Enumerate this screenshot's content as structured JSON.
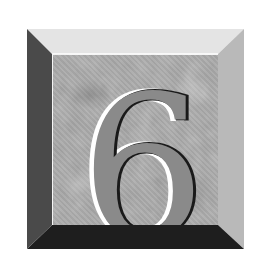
{
  "tile": {
    "numeral": "6",
    "colors": {
      "background": "#ffffff",
      "face": "#a9a9a9",
      "numeral_fill": "#8a8a8a",
      "numeral_outline": "#1a1a1a",
      "numeral_highlight": "#ffffff",
      "bevel_top": "#e4e4e4",
      "bevel_right": "#b9b9b9",
      "bevel_bottom": "#1e1e1e",
      "bevel_left": "#4a4a4a"
    }
  }
}
